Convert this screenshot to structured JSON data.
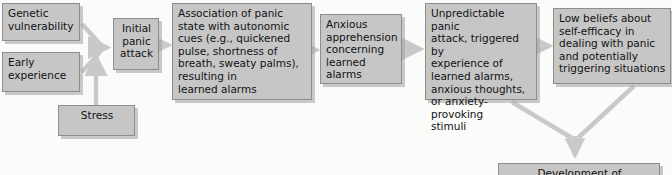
{
  "diagram": {
    "type": "flowchart",
    "colors": {
      "node_fill": "#c6c6c6",
      "node_border": "#8d8d8d",
      "arrow": "#c9c9c9",
      "background": "#fbfbfa",
      "text": "#121212"
    },
    "nodes": [
      {
        "id": "genetic",
        "label": "Genetic\nvulnerability"
      },
      {
        "id": "early",
        "label": "Early\nexperience"
      },
      {
        "id": "stress",
        "label": "Stress"
      },
      {
        "id": "initial",
        "label": "Initial\npanic\nattack"
      },
      {
        "id": "association",
        "label": "Association of panic\nstate with autonomic\ncues (e.g., quickened\npulse, shortness of\nbreath, sweaty palms),\nresulting in\nlearned alarms"
      },
      {
        "id": "anxious",
        "label": "Anxious\napprehension\nconcerning\nlearned\nalarms"
      },
      {
        "id": "unpredict",
        "label": "Unpredictable panic\nattack, triggered by\nexperience of\nlearned alarms,\nanxious thoughts,\nor anxiety-provoking\nstimuli"
      },
      {
        "id": "lowbeliefs",
        "label": "Low beliefs about\nself-efficacy in\ndealing with panic\nand potentially\ntriggering situations"
      },
      {
        "id": "development",
        "label": "Development of"
      }
    ],
    "edges": [
      {
        "from": "genetic",
        "to": "initial",
        "style": "merge-arrow"
      },
      {
        "from": "early",
        "to": "initial",
        "style": "merge-arrow"
      },
      {
        "from": "stress",
        "to": "initial",
        "style": "elbow-arrow"
      },
      {
        "from": "initial",
        "to": "association",
        "style": "straight-arrow"
      },
      {
        "from": "association",
        "to": "anxious",
        "style": "straight-arrow"
      },
      {
        "from": "anxious",
        "to": "unpredict",
        "style": "straight-arrow"
      },
      {
        "from": "unpredict",
        "to": "lowbeliefs",
        "style": "straight-arrow"
      },
      {
        "from": "unpredict",
        "to": "development",
        "style": "converge-arrow"
      },
      {
        "from": "lowbeliefs",
        "to": "development",
        "style": "converge-arrow"
      }
    ]
  }
}
